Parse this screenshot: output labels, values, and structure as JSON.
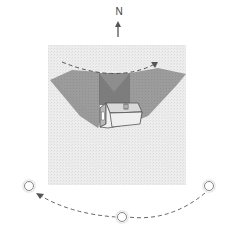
{
  "diagram": {
    "compass": {
      "label": "N",
      "direction": "up"
    },
    "site": {
      "fill": "#ececec",
      "x": 48,
      "y": 45,
      "width": 138,
      "height": 140
    },
    "shadows": {
      "color": "#8a8a8a",
      "left": "morning",
      "center": "noon",
      "right": "afternoon"
    },
    "house": {
      "top_color": "#d8d8d8",
      "front_color": "#efefef",
      "side_color": "#b5b5b5",
      "stroke": "#555555"
    },
    "sun_path_top": {
      "style": "dashed",
      "arrow": "end-right"
    },
    "sun_path_bottom": {
      "style": "dashed",
      "arrow": "end-left"
    },
    "suns": [
      {
        "name": "sun-east",
        "cx": 29,
        "cy": 186
      },
      {
        "name": "sun-south",
        "cx": 122,
        "cy": 217
      },
      {
        "name": "sun-west",
        "cx": 209,
        "cy": 186
      }
    ],
    "colors": {
      "line": "#555555",
      "sun_stroke": "#666666",
      "sun_glow": "#e6e6e6"
    }
  }
}
